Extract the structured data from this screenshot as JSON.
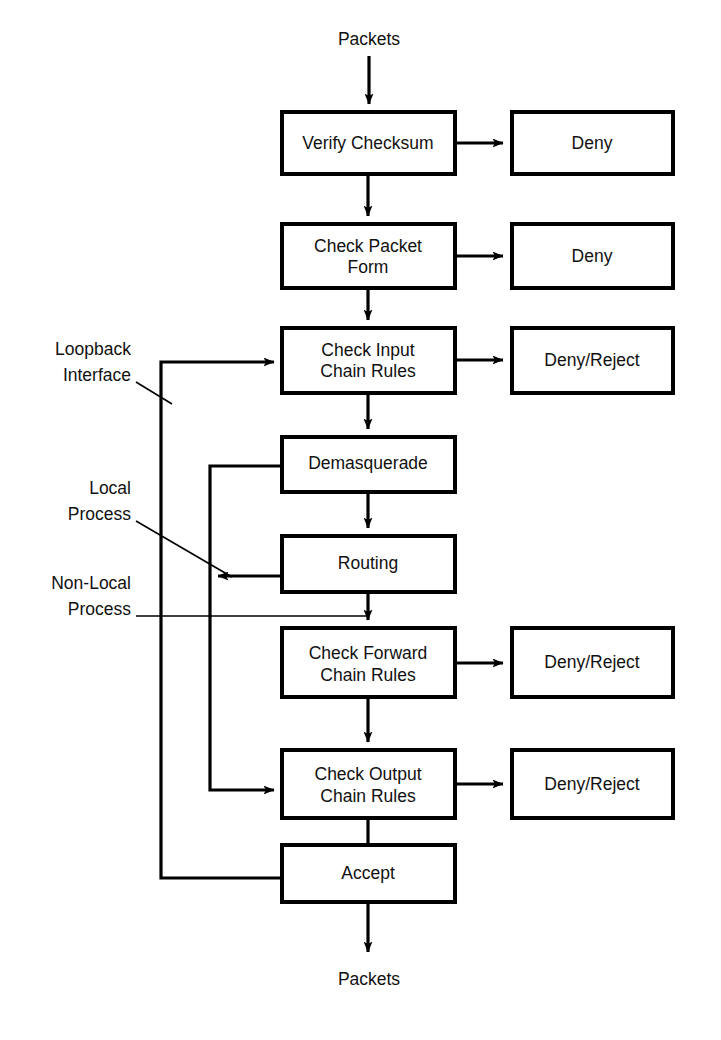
{
  "diagram": {
    "background_color": "#ffffff",
    "line_color": "#000000",
    "text_color": "#111111",
    "endpoints": {
      "input_label": "Packets",
      "output_label": "Packets"
    },
    "side_labels": [
      {
        "id": "loopback",
        "line1": "Loopback",
        "line2": "Interface"
      },
      {
        "id": "local-process",
        "line1": "Local",
        "line2": "Process"
      },
      {
        "id": "non-local-process",
        "line1": "Non-Local",
        "line2": "Process"
      }
    ],
    "main_boxes": [
      {
        "id": "verify-checksum",
        "line1": "Verify Checksum",
        "line2": ""
      },
      {
        "id": "check-packet-form",
        "line1": "Check Packet",
        "line2": "Form"
      },
      {
        "id": "check-input-chain-rules",
        "line1": "Check Input",
        "line2": "Chain Rules"
      },
      {
        "id": "demasquerade",
        "line1": "Demasquerade",
        "line2": ""
      },
      {
        "id": "routing",
        "line1": "Routing",
        "line2": ""
      },
      {
        "id": "check-forward-chain-rules",
        "line1": "Check Forward",
        "line2": "Chain Rules"
      },
      {
        "id": "check-output-chain-rules",
        "line1": "Check Output",
        "line2": "Chain Rules"
      },
      {
        "id": "accept",
        "line1": "Accept",
        "line2": ""
      }
    ],
    "outcome_boxes": [
      {
        "id": "deny-checksum",
        "label": "Deny"
      },
      {
        "id": "deny-packet-form",
        "label": "Deny"
      },
      {
        "id": "deny-reject-input",
        "label": "Deny/Reject"
      },
      {
        "id": "deny-reject-forward",
        "label": "Deny/Reject"
      },
      {
        "id": "deny-reject-output",
        "label": "Deny/Reject"
      }
    ]
  }
}
